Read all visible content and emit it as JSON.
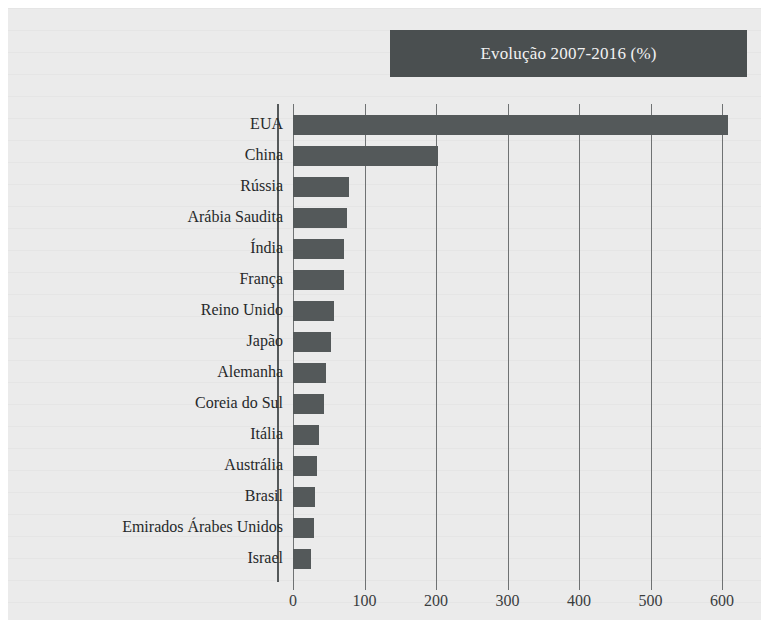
{
  "figure": {
    "title": "Evolução 2007-2016 (%)",
    "colors": {
      "paper": "#ebebeb",
      "bar": "#54595a",
      "banner": "#4a4f50",
      "banner_text": "#f2f2f2",
      "gridline": "#6f7273",
      "axis": "#55595a",
      "text": "#26292a"
    }
  },
  "chart_data": {
    "type": "bar",
    "orientation": "horizontal",
    "title": "Evolução 2007-2016 (%)",
    "xlabel": "",
    "ylabel": "",
    "xlim": [
      0,
      620
    ],
    "xticks": [
      0,
      100,
      200,
      300,
      400,
      500,
      600
    ],
    "xticklabels": [
      "0",
      "100",
      "200",
      "300",
      "400",
      "500",
      "600"
    ],
    "grid": "vertical",
    "legend": "none",
    "categories": [
      "EUA",
      "China",
      "Rússia",
      "Arábia Saudita",
      "Índia",
      "França",
      "Reino Unido",
      "Japão",
      "Alemanha",
      "Coreia do Sul",
      "Itália",
      "Austrália",
      "Brasil",
      "Emirados Árabes Unidos",
      "Israel"
    ],
    "values": [
      608,
      203,
      79,
      76,
      72,
      71,
      58,
      53,
      46,
      43,
      37,
      33,
      31,
      29,
      25
    ],
    "series": [
      {
        "name": "Evolução 2007-2016 (%)",
        "values": [
          608,
          203,
          79,
          76,
          72,
          71,
          58,
          53,
          46,
          43,
          37,
          33,
          31,
          29,
          25
        ]
      }
    ]
  }
}
